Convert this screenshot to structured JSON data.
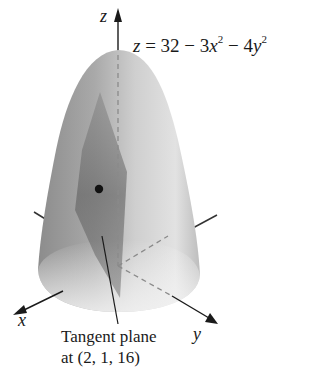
{
  "figure": {
    "equation": {
      "lhs": "z",
      "eq": " = 32 − 3",
      "x_var": "x",
      "x_exp": "2",
      "minus": " − 4",
      "y_var": "y",
      "y_exp": "2"
    },
    "axes": {
      "x_label": "x",
      "y_label": "y",
      "z_label": "z"
    },
    "annotation": {
      "line1": "Tangent plane",
      "line2": "at (2, 1, 16)"
    },
    "point": {
      "x": 2,
      "y": 1,
      "z": 16
    },
    "surface": "paraboloid",
    "colors": {
      "surface_dark": "#7a7a7a",
      "surface_light": "#e6e6e6",
      "plane": "#6e6e6e",
      "ink": "#1a1a1a"
    }
  }
}
